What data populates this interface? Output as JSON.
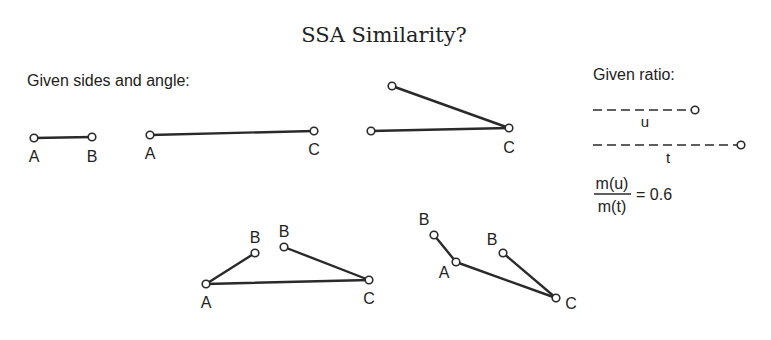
{
  "title": "SSA Similarity?",
  "given_sides_label": "Given sides and angle:",
  "given_ratio_label": "Given ratio:",
  "ratio": {
    "numerator": "m(u)",
    "denominator": "m(t)",
    "equals": "= 0.6",
    "segment_u_label": "u",
    "segment_t_label": "t"
  },
  "labels": {
    "a": "A",
    "b": "B",
    "c": "C"
  },
  "colors": {
    "stroke": "#2a2a2a",
    "text": "#222222",
    "background": "#ffffff"
  }
}
